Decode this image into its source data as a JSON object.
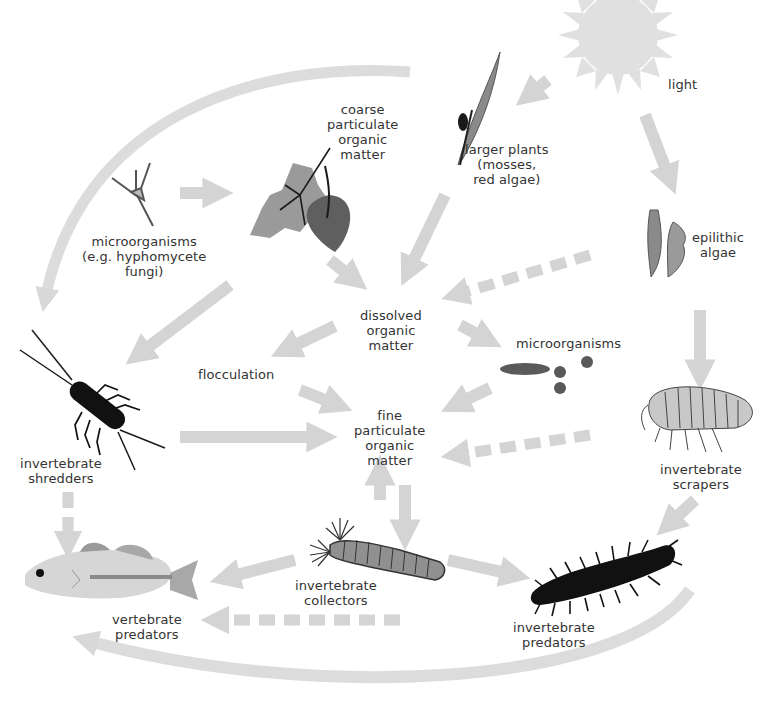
{
  "diagram": {
    "colors": {
      "arrow": "#d4d4d4",
      "sun": "#dedede",
      "dark_organism": "#1a1a1a",
      "mid_organism": "#8a8a8a",
      "light_organism": "#c8c8c8",
      "text": "#333333"
    },
    "nodes": {
      "light": {
        "lines": [
          "light"
        ]
      },
      "larger_plants": {
        "lines": [
          "larger plants",
          "(mosses,",
          "red algae)"
        ]
      },
      "coarse_pom": {
        "lines": [
          "coarse",
          "particulate",
          "organic",
          "matter"
        ]
      },
      "microorganisms_fungi": {
        "lines": [
          "microorganisms",
          "(e.g. hyphomycete",
          "fungi)"
        ]
      },
      "epilithic_algae": {
        "lines": [
          "epilithic",
          "algae"
        ]
      },
      "dissolved_om": {
        "lines": [
          "dissolved",
          "organic",
          "matter"
        ]
      },
      "flocculation": {
        "lines": [
          "flocculation"
        ]
      },
      "microorganisms": {
        "lines": [
          "microorganisms"
        ]
      },
      "fine_pom": {
        "lines": [
          "fine",
          "particulate",
          "organic",
          "matter"
        ]
      },
      "shredders": {
        "lines": [
          "invertebrate",
          "shredders"
        ]
      },
      "scrapers": {
        "lines": [
          "invertebrate",
          "scrapers"
        ]
      },
      "collectors": {
        "lines": [
          "invertebrate",
          "collectors"
        ]
      },
      "vertebrate_predators": {
        "lines": [
          "vertebrate",
          "predators"
        ]
      },
      "invertebrate_predators": {
        "lines": [
          "invertebrate",
          "predators"
        ]
      }
    },
    "edges": [
      {
        "from": "light",
        "to": "larger_plants",
        "style": "solid"
      },
      {
        "from": "light",
        "to": "epilithic_algae",
        "style": "solid"
      },
      {
        "from": "microorganisms_fungi",
        "to": "coarse_pom",
        "style": "solid"
      },
      {
        "from": "coarse_pom",
        "to": "dissolved_om",
        "style": "solid"
      },
      {
        "from": "larger_plants",
        "to": "dissolved_om",
        "style": "solid"
      },
      {
        "from": "epilithic_algae",
        "to": "dissolved_om",
        "style": "dashed"
      },
      {
        "from": "coarse_pom",
        "to": "shredders",
        "style": "solid"
      },
      {
        "from": "larger_plants",
        "to": "shredders",
        "style": "solid",
        "curved": true
      },
      {
        "from": "dissolved_om",
        "to": "flocculation",
        "style": "solid"
      },
      {
        "from": "dissolved_om",
        "to": "microorganisms",
        "style": "solid"
      },
      {
        "from": "flocculation",
        "to": "fine_pom",
        "style": "solid"
      },
      {
        "from": "microorganisms",
        "to": "fine_pom",
        "style": "solid"
      },
      {
        "from": "shredders",
        "to": "fine_pom",
        "style": "solid"
      },
      {
        "from": "scrapers",
        "to": "fine_pom",
        "style": "dashed"
      },
      {
        "from": "epilithic_algae",
        "to": "scrapers",
        "style": "solid"
      },
      {
        "from": "fine_pom",
        "to": "collectors",
        "style": "solid"
      },
      {
        "from": "collectors",
        "to": "fine_pom",
        "style": "solid"
      },
      {
        "from": "shredders",
        "to": "vertebrate_predators",
        "style": "dashed"
      },
      {
        "from": "collectors",
        "to": "vertebrate_predators",
        "style": "solid"
      },
      {
        "from": "invertebrate_predators",
        "to": "vertebrate_predators",
        "style": "dashed"
      },
      {
        "from": "collectors",
        "to": "invertebrate_predators",
        "style": "solid"
      },
      {
        "from": "scrapers",
        "to": "invertebrate_predators",
        "style": "solid"
      },
      {
        "from": "invertebrate_predators",
        "to": "vertebrate_predators",
        "style": "solid",
        "curved": true
      }
    ]
  }
}
